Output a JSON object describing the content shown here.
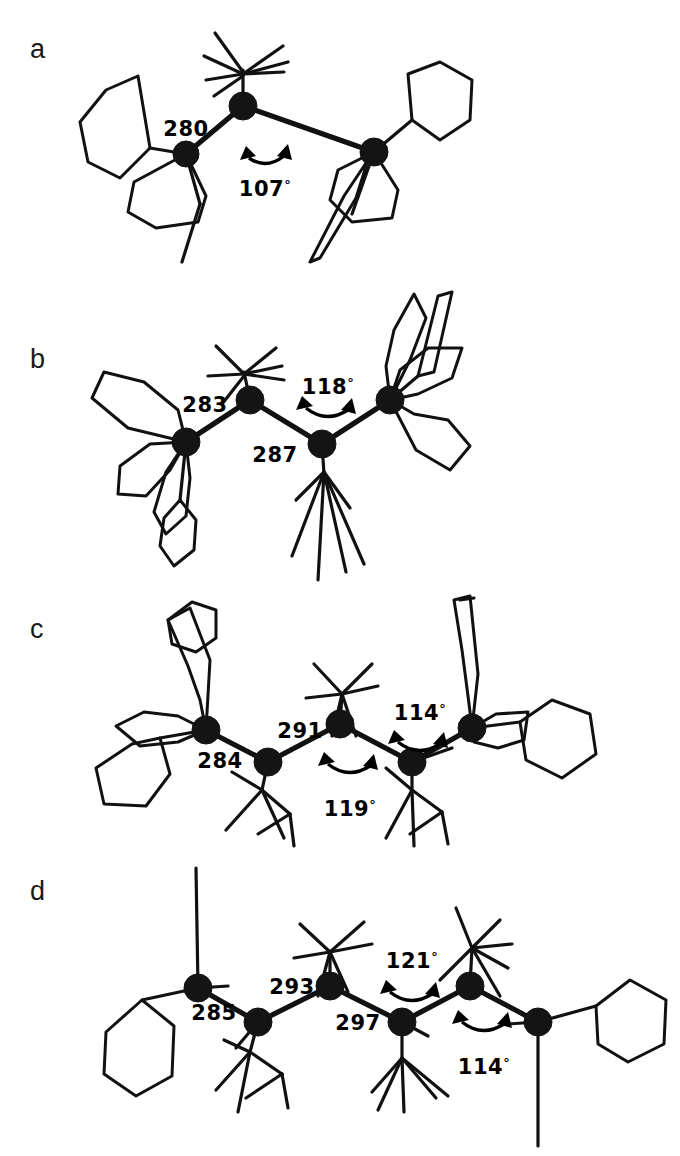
{
  "figure": {
    "background_color": "#ffffff",
    "ink_color": "#111111",
    "units_note": "pm"
  },
  "panels": [
    {
      "letter": "a",
      "chain_length": 3,
      "bond_labels": [
        "280"
      ],
      "angle_labels": [
        "107°"
      ],
      "angles_numeric": [
        107
      ],
      "bonds_numeric": [
        280
      ]
    },
    {
      "letter": "b",
      "chain_length": 4,
      "bond_labels": [
        "283",
        "287"
      ],
      "angle_labels": [
        "118°"
      ],
      "angles_numeric": [
        118
      ],
      "bonds_numeric": [
        283,
        287
      ]
    },
    {
      "letter": "c",
      "chain_length": 5,
      "bond_labels": [
        "284",
        "291"
      ],
      "angle_labels": [
        "119°",
        "114°"
      ],
      "angles_numeric": [
        119,
        114
      ],
      "bonds_numeric": [
        284,
        291
      ]
    },
    {
      "letter": "d",
      "chain_length": 6,
      "bond_labels": [
        "285",
        "293",
        "297"
      ],
      "angle_labels": [
        "121°",
        "114°"
      ],
      "angles_numeric": [
        121,
        114
      ],
      "bonds_numeric": [
        285,
        293,
        297
      ]
    }
  ],
  "labels": {
    "a_letter": "a",
    "b_letter": "b",
    "c_letter": "c",
    "d_letter": "d",
    "a_bond_1": "280",
    "a_angle_1_num": "107",
    "a_angle_1_deg": "°",
    "b_bond_1": "283",
    "b_bond_2": "287",
    "b_angle_1_num": "118",
    "b_angle_1_deg": "°",
    "c_bond_1": "284",
    "c_bond_2": "291",
    "c_angle_1_num": "119",
    "c_angle_1_deg": "°",
    "c_angle_2_num": "114",
    "c_angle_2_deg": "°",
    "d_bond_1": "285",
    "d_bond_2": "293",
    "d_bond_3": "297",
    "d_angle_1_num": "121",
    "d_angle_1_deg": "°",
    "d_angle_2_num": "114",
    "d_angle_2_deg": "°"
  }
}
